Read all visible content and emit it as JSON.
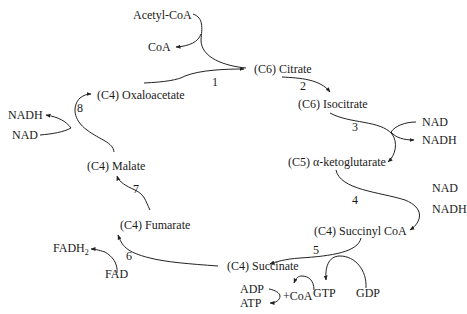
{
  "colors": {
    "ink": "#1a1a1a",
    "background": "#ffffff"
  },
  "metabolites": {
    "acetyl_coa": "Acetyl-CoA",
    "coa": "CoA",
    "citrate": "(C6) Citrate",
    "isocitrate": "(C6) Isocitrate",
    "ketoglutarate": "(C5) α-ketoglutarate",
    "succinyl_coa": "(C4) Succinyl CoA",
    "succinate": "(C4) Succinate",
    "fumarate": "(C4) Fumarate",
    "malate": "(C4) Malate",
    "oxaloacetate": "(C4) Oxaloacetate"
  },
  "cofactors": {
    "nad_3": "NAD",
    "nadh_3": "NADH",
    "nad_4": "NAD",
    "nadh_4": "NADH",
    "gtp": "GTP",
    "gdp": "GDP",
    "adp": "ADP",
    "atp": "ATP",
    "plus_coa": "+CoA",
    "fadh2": "FADH",
    "fadh2_sub": "2",
    "fad": "FAD",
    "nadh_8": "NADH",
    "nad_8": "NAD"
  },
  "steps": [
    "1",
    "2",
    "3",
    "4",
    "5",
    "6",
    "7",
    "8"
  ]
}
